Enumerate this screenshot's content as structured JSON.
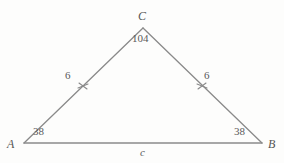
{
  "figure": {
    "kind": "triangle-diagram",
    "stroke_color": "#8a8a8a",
    "background_color": "#fdfdfc",
    "text_color": "#5a5a5a"
  },
  "vertices": {
    "A": {
      "label": "A",
      "x": 24,
      "y": 143
    },
    "B": {
      "label": "B",
      "x": 262,
      "y": 143
    },
    "C": {
      "label": "C",
      "x": 143,
      "y": 28
    }
  },
  "angles": {
    "at_A": "38",
    "at_B": "38",
    "at_C": "104"
  },
  "sides": {
    "left_leg": "6",
    "right_leg": "6",
    "base": "c"
  },
  "tick_marks": {
    "left_leg": "x-tick-mark",
    "right_leg": "x-tick-mark"
  }
}
